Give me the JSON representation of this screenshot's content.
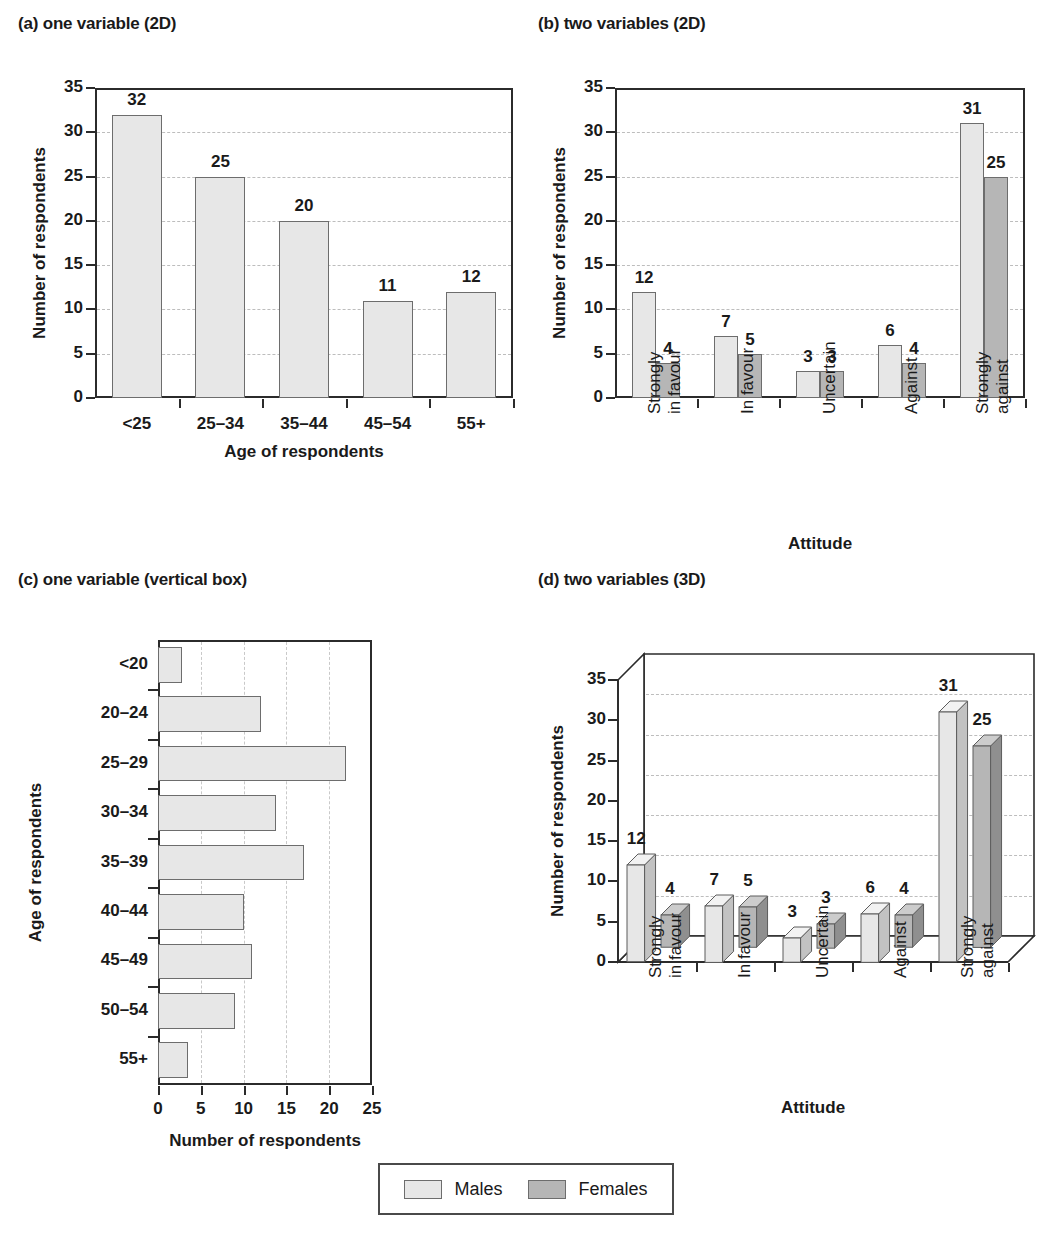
{
  "legend": {
    "items": [
      {
        "label": "Males",
        "color": "#e7e7e7",
        "key": "males"
      },
      {
        "label": "Females",
        "color": "#b6b6b6",
        "key": "females"
      }
    ]
  },
  "panels": {
    "a": {
      "title": "(a) one variable (2D)"
    },
    "b": {
      "title": "(b) two variables (2D)"
    },
    "c": {
      "title": "(c) one variable (vertical box)"
    },
    "d": {
      "title": "(d) two variables (3D)"
    }
  },
  "chart_data": [
    {
      "id": "a",
      "type": "bar",
      "title": "(a) one variable (2D)",
      "xlabel": "Age of respondents",
      "ylabel": "Number of respondents",
      "categories": [
        "<25",
        "25–34",
        "35–44",
        "45–54",
        "55+"
      ],
      "values": [
        32,
        25,
        20,
        11,
        12
      ],
      "data_labels": [
        "32",
        "25",
        "20",
        "11",
        "12"
      ],
      "ylim": [
        0,
        35
      ],
      "yticks": [
        0,
        5,
        10,
        15,
        20,
        25,
        30,
        35
      ],
      "ytick_labels": [
        "0",
        "5",
        "10",
        "15",
        "20",
        "25",
        "30",
        "35"
      ],
      "grid": "horizontal-dashed",
      "legend_position": "none",
      "series_name": "Males"
    },
    {
      "id": "b",
      "type": "bar",
      "title": "(b) two variables (2D)",
      "xlabel": "Attitude",
      "ylabel": "Number of respondents",
      "categories": [
        "Strongly in favour",
        "In favour",
        "Uncertain",
        "Against",
        "Strongly against"
      ],
      "category_lines": [
        [
          "Strongly",
          "in favour"
        ],
        [
          "In favour"
        ],
        [
          "Uncertain"
        ],
        [
          "Against"
        ],
        [
          "Strongly",
          "against"
        ]
      ],
      "series": [
        {
          "name": "Males",
          "values": [
            12,
            7,
            3,
            6,
            31
          ],
          "color": "#e7e7e7"
        },
        {
          "name": "Females",
          "values": [
            4,
            5,
            3,
            4,
            25
          ],
          "color": "#b6b6b6"
        }
      ],
      "ylim": [
        0,
        35
      ],
      "yticks": [
        0,
        5,
        10,
        15,
        20,
        25,
        30,
        35
      ],
      "ytick_labels": [
        "0",
        "5",
        "10",
        "15",
        "20",
        "25",
        "30",
        "35"
      ],
      "grid": "horizontal-dashed",
      "legend_position": "bottom-shared"
    },
    {
      "id": "c",
      "type": "bar",
      "orientation": "horizontal",
      "title": "(c) one variable (vertical box)",
      "xlabel": "Number of respondents",
      "ylabel": "Age of respondents",
      "categories": [
        "<20",
        "20–24",
        "25–29",
        "30–34",
        "35–39",
        "40–44",
        "45–49",
        "50–54",
        "55+"
      ],
      "values": [
        2.8,
        12,
        22,
        13.8,
        17,
        10,
        11,
        9,
        3.5
      ],
      "xlim": [
        0,
        25
      ],
      "xticks": [
        0,
        5,
        10,
        15,
        20,
        25
      ],
      "xtick_labels": [
        "0",
        "5",
        "10",
        "15",
        "20",
        "25"
      ],
      "grid": "vertical-dashed",
      "legend_position": "none",
      "series_name": "Males"
    },
    {
      "id": "d",
      "type": "bar",
      "render": "3d",
      "title": "(d) two variables (3D)",
      "xlabel": "Attitude",
      "ylabel": "Number of respondents",
      "categories": [
        "Strongly in favour",
        "In favour",
        "Uncertain",
        "Against",
        "Strongly against"
      ],
      "category_lines": [
        [
          "Strongly",
          "in favour"
        ],
        [
          "In favour"
        ],
        [
          "Uncertain"
        ],
        [
          "Against"
        ],
        [
          "Strongly",
          "against"
        ]
      ],
      "series": [
        {
          "name": "Males",
          "values": [
            12,
            7,
            3,
            6,
            31
          ],
          "color": "#e7e7e7"
        },
        {
          "name": "Females",
          "values": [
            4,
            5,
            3,
            4,
            25
          ],
          "color": "#b6b6b6"
        }
      ],
      "ylim": [
        0,
        35
      ],
      "yticks": [
        0,
        5,
        10,
        15,
        20,
        25,
        30,
        35
      ],
      "ytick_labels": [
        "0",
        "5",
        "10",
        "15",
        "20",
        "25",
        "30",
        "35"
      ],
      "grid": "horizontal-dashed",
      "legend_position": "bottom-shared"
    }
  ]
}
